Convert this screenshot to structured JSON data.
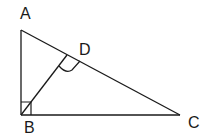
{
  "diagram": {
    "stroke_color": "#1a1a1a",
    "background": "#ffffff",
    "points": {
      "A": {
        "label": "A",
        "x": 21,
        "y": 30
      },
      "B": {
        "label": "B",
        "x": 21,
        "y": 115
      },
      "C": {
        "label": "C",
        "x": 180,
        "y": 115
      },
      "D": {
        "label": "D",
        "x": 67,
        "y": 53
      }
    },
    "segments": [
      "AB",
      "BC",
      "AC",
      "BD"
    ],
    "right_angles": [
      "ABC",
      "BDC"
    ]
  }
}
